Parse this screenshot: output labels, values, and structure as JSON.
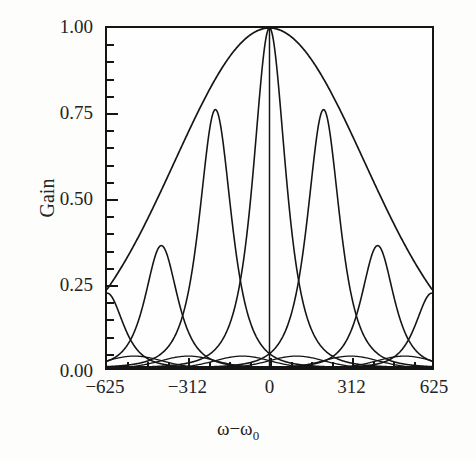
{
  "figure": {
    "background": "#fdfdfc",
    "ink_color": "#151515"
  },
  "axis": {
    "y_label": "Gain",
    "x_label_omega": "ω",
    "x_label_minus": "−",
    "x_label_omega2": "ω",
    "x_label_sub": "0"
  },
  "chart_data": {
    "type": "line",
    "title": "",
    "subtitle": "",
    "xlabel": "ω − ω₀",
    "ylabel": "Gain",
    "xlim": [
      -625,
      625
    ],
    "ylim": [
      0.0,
      1.0
    ],
    "grid": false,
    "legend": "none",
    "x_ticks_major": [
      -625,
      -312,
      0,
      312,
      625
    ],
    "x_tick_labels": [
      "−625",
      "−312",
      "0",
      "312",
      "625"
    ],
    "x_ticks_minor_step": 78,
    "y_ticks_major": [
      0.0,
      0.25,
      0.5,
      0.75,
      1.0
    ],
    "y_tick_labels": [
      "0.00",
      "0.25",
      "0.50",
      "0.75",
      "1.00"
    ],
    "y_ticks_minor_step": 0.05,
    "tick_direction": "in",
    "series": [
      {
        "name": "envelope",
        "kind": "gaussian-envelope",
        "peak_x": 0,
        "peak_y": 1.0,
        "half_width": 430,
        "x": [
          -625,
          -550,
          -470,
          -390,
          -312,
          -235,
          -156,
          -78,
          0,
          78,
          156,
          235,
          312,
          390,
          470,
          550,
          625
        ],
        "y": [
          0.21,
          0.29,
          0.38,
          0.5,
          0.62,
          0.74,
          0.85,
          0.96,
          1.0,
          0.96,
          0.85,
          0.74,
          0.62,
          0.5,
          0.38,
          0.29,
          0.21
        ]
      },
      {
        "name": "mode-0",
        "kind": "resonance",
        "center": 0,
        "peak": 1.0,
        "hwhm": 58
      },
      {
        "name": "mode-plus-1",
        "kind": "resonance",
        "center": 208,
        "peak": 0.76,
        "hwhm": 58
      },
      {
        "name": "mode-minus-1",
        "kind": "resonance",
        "center": -208,
        "peak": 0.76,
        "hwhm": 58
      },
      {
        "name": "mode-plus-2",
        "kind": "resonance",
        "center": 416,
        "peak": 0.36,
        "hwhm": 58
      },
      {
        "name": "mode-minus-2",
        "kind": "resonance",
        "center": -416,
        "peak": 0.36,
        "hwhm": 58
      },
      {
        "name": "mode-plus-3",
        "kind": "resonance",
        "center": 624,
        "peak": 0.22,
        "hwhm": 58
      },
      {
        "name": "mode-minus-3",
        "kind": "resonance",
        "center": -624,
        "peak": 0.22,
        "hwhm": 58
      },
      {
        "name": "baseline-lobes",
        "kind": "low-gain-lobes",
        "centers": [
          -520,
          -312,
          -104,
          104,
          312,
          520
        ],
        "peak": 0.035
      }
    ],
    "peaks": [
      {
        "x": 0,
        "y": 1.0
      },
      {
        "x": -208,
        "y": 0.76
      },
      {
        "x": 208,
        "y": 0.76
      },
      {
        "x": -416,
        "y": 0.36
      },
      {
        "x": 416,
        "y": 0.36
      },
      {
        "x": -624,
        "y": 0.22
      },
      {
        "x": 624,
        "y": 0.22
      }
    ]
  }
}
